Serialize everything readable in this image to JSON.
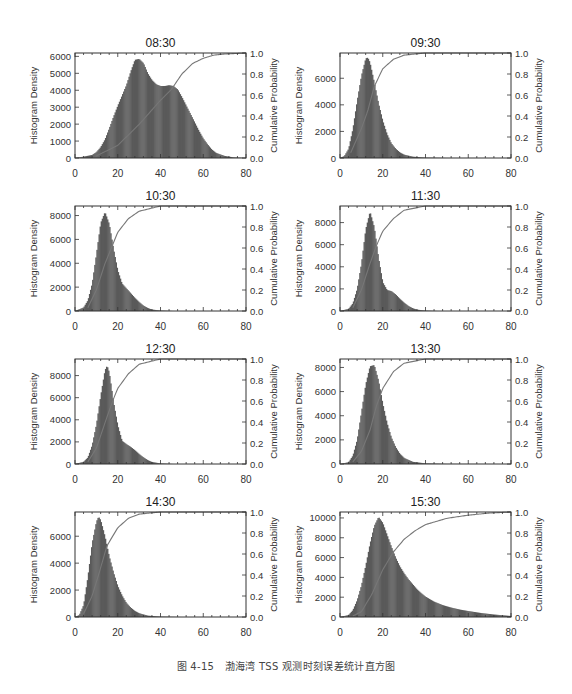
{
  "caption": "图 4-15　渤海湾 TSS 观测时刻误差统计直方图",
  "colors": {
    "bar": "#5a5a5a",
    "cdf": "#777777",
    "axis": "#333333",
    "text": "#333333"
  },
  "chart_data": [
    {
      "type": "bar",
      "title": "08:30",
      "xlabel": "",
      "ylabel": "Histogram Density",
      "y2label": "Cumulative Probability",
      "xlim": [
        0,
        80
      ],
      "ylim": [
        0,
        6200
      ],
      "y2lim": [
        0,
        1.0
      ],
      "xticks": [
        0,
        20,
        40,
        60,
        80
      ],
      "yticks": [
        0,
        1000,
        2000,
        3000,
        4000,
        5000,
        6000
      ],
      "y2ticks": [
        0.0,
        0.2,
        0.4,
        0.6,
        0.8,
        1.0
      ],
      "x": [
        0,
        4,
        8,
        10,
        12,
        14,
        16,
        18,
        20,
        22,
        24,
        26,
        28,
        30,
        32,
        34,
        36,
        38,
        40,
        42,
        44,
        46,
        48,
        50,
        52,
        54,
        56,
        58,
        60,
        62,
        64,
        66,
        70,
        74,
        80
      ],
      "density": [
        0,
        80,
        180,
        350,
        650,
        1100,
        1750,
        2450,
        3100,
        3700,
        4300,
        5100,
        5800,
        5850,
        5600,
        5000,
        4600,
        4350,
        4250,
        4250,
        4300,
        4250,
        4050,
        3600,
        3100,
        2600,
        2100,
        1600,
        1150,
        800,
        500,
        300,
        120,
        40,
        0
      ],
      "cdf_x": [
        10,
        20,
        30,
        40,
        45,
        50,
        55,
        60,
        65,
        70,
        80
      ],
      "cdf": [
        0.02,
        0.12,
        0.32,
        0.55,
        0.65,
        0.8,
        0.9,
        0.95,
        0.98,
        0.99,
        1.0
      ]
    },
    {
      "type": "bar",
      "title": "09:30",
      "xlabel": "",
      "ylabel": "Histogram Density",
      "y2label": "Cumulative Probability",
      "xlim": [
        0,
        80
      ],
      "ylim": [
        0,
        7900
      ],
      "y2lim": [
        0,
        1.0
      ],
      "xticks": [
        0,
        20,
        40,
        60,
        80
      ],
      "yticks": [
        0,
        2000,
        4000,
        6000
      ],
      "y2ticks": [
        0.0,
        0.2,
        0.4,
        0.6,
        0.8,
        1.0
      ],
      "x": [
        0,
        2,
        4,
        6,
        8,
        10,
        12,
        13,
        14,
        16,
        18,
        20,
        22,
        24,
        26,
        28,
        30,
        34,
        40,
        50,
        80
      ],
      "density": [
        0,
        150,
        700,
        2200,
        4300,
        6200,
        7500,
        7550,
        7200,
        5700,
        4100,
        2800,
        1800,
        1100,
        700,
        420,
        250,
        100,
        30,
        5,
        0
      ],
      "cdf_x": [
        5,
        10,
        13,
        16,
        20,
        25,
        30,
        40,
        80
      ],
      "cdf": [
        0.05,
        0.28,
        0.45,
        0.68,
        0.85,
        0.94,
        0.98,
        1.0,
        1.0
      ]
    },
    {
      "type": "bar",
      "title": "10:30",
      "xlabel": "",
      "ylabel": "Histogram Density",
      "y2label": "Cumulative Probability",
      "xlim": [
        0,
        80
      ],
      "ylim": [
        0,
        8800
      ],
      "y2lim": [
        0,
        1.0
      ],
      "xticks": [
        0,
        20,
        40,
        60,
        80
      ],
      "yticks": [
        0,
        2000,
        4000,
        6000,
        8000
      ],
      "y2ticks": [
        0.0,
        0.2,
        0.4,
        0.6,
        0.8,
        1.0
      ],
      "x": [
        0,
        4,
        6,
        8,
        10,
        12,
        14,
        16,
        18,
        20,
        22,
        24,
        26,
        28,
        30,
        32,
        34,
        36,
        40,
        46,
        80
      ],
      "density": [
        0,
        300,
        900,
        2300,
        4800,
        7400,
        8300,
        7300,
        5200,
        3400,
        2300,
        1900,
        1500,
        1100,
        750,
        450,
        250,
        120,
        40,
        0,
        0
      ],
      "cdf_x": [
        6,
        10,
        14,
        17,
        20,
        25,
        30,
        40,
        80
      ],
      "cdf": [
        0.03,
        0.2,
        0.45,
        0.6,
        0.75,
        0.88,
        0.95,
        1.0,
        1.0
      ]
    },
    {
      "type": "bar",
      "title": "11:30",
      "xlabel": "",
      "ylabel": "Histogram Density",
      "y2label": "Cumulative Probability",
      "xlim": [
        0,
        80
      ],
      "ylim": [
        0,
        9500
      ],
      "y2lim": [
        0,
        1.0
      ],
      "xticks": [
        0,
        20,
        40,
        60,
        80
      ],
      "yticks": [
        0,
        2000,
        4000,
        6000,
        8000
      ],
      "y2ticks": [
        0.0,
        0.2,
        0.4,
        0.6,
        0.8,
        1.0
      ],
      "x": [
        0,
        4,
        6,
        8,
        10,
        12,
        14,
        16,
        18,
        20,
        22,
        24,
        26,
        28,
        30,
        32,
        34,
        36,
        40,
        46,
        80
      ],
      "density": [
        0,
        200,
        700,
        2000,
        4300,
        7400,
        9000,
        7600,
        4800,
        2600,
        1900,
        1800,
        1500,
        1100,
        750,
        450,
        250,
        120,
        40,
        0,
        0
      ],
      "cdf_x": [
        6,
        10,
        14,
        17,
        20,
        25,
        30,
        40,
        80
      ],
      "cdf": [
        0.03,
        0.2,
        0.45,
        0.62,
        0.76,
        0.88,
        0.96,
        1.0,
        1.0
      ]
    },
    {
      "type": "bar",
      "title": "12:30",
      "xlabel": "",
      "ylabel": "Histogram Density",
      "y2label": "Cumulative Probability",
      "xlim": [
        0,
        80
      ],
      "ylim": [
        0,
        9500
      ],
      "y2lim": [
        0,
        1.0
      ],
      "xticks": [
        0,
        20,
        40,
        60,
        80
      ],
      "yticks": [
        0,
        2000,
        4000,
        6000,
        8000
      ],
      "y2ticks": [
        0.0,
        0.2,
        0.4,
        0.6,
        0.8,
        1.0
      ],
      "x": [
        0,
        4,
        6,
        8,
        10,
        12,
        14,
        15,
        16,
        18,
        20,
        22,
        24,
        26,
        28,
        30,
        32,
        34,
        36,
        40,
        46,
        80
      ],
      "density": [
        0,
        200,
        600,
        1700,
        3600,
        6200,
        8500,
        8900,
        8300,
        5600,
        3500,
        2100,
        1800,
        1550,
        1250,
        900,
        600,
        350,
        180,
        50,
        0,
        0
      ],
      "cdf_x": [
        6,
        10,
        15,
        18,
        20,
        25,
        30,
        40,
        80
      ],
      "cdf": [
        0.02,
        0.15,
        0.45,
        0.62,
        0.72,
        0.86,
        0.95,
        1.0,
        1.0
      ]
    },
    {
      "type": "bar",
      "title": "13:30",
      "xlabel": "",
      "ylabel": "Histogram Density",
      "y2label": "Cumulative Probability",
      "xlim": [
        0,
        80
      ],
      "ylim": [
        0,
        8700
      ],
      "y2lim": [
        0,
        1.0
      ],
      "xticks": [
        0,
        20,
        40,
        60,
        80
      ],
      "yticks": [
        0,
        2000,
        4000,
        6000,
        8000
      ],
      "y2ticks": [
        0.0,
        0.2,
        0.4,
        0.6,
        0.8,
        1.0
      ],
      "x": [
        0,
        4,
        6,
        8,
        10,
        12,
        14,
        16,
        18,
        20,
        22,
        24,
        26,
        28,
        30,
        34,
        40,
        50,
        80
      ],
      "density": [
        0,
        150,
        700,
        2000,
        4300,
        6600,
        8100,
        8200,
        6900,
        5000,
        3400,
        2200,
        1400,
        850,
        500,
        180,
        50,
        10,
        0
      ],
      "cdf_x": [
        6,
        10,
        14,
        17,
        20,
        25,
        30,
        40,
        80
      ],
      "cdf": [
        0.02,
        0.12,
        0.32,
        0.55,
        0.72,
        0.88,
        0.96,
        1.0,
        1.0
      ]
    },
    {
      "type": "bar",
      "title": "14:30",
      "xlabel": "",
      "ylabel": "Histogram Density",
      "y2label": "Cumulative Probability",
      "xlim": [
        0,
        80
      ],
      "ylim": [
        0,
        7800
      ],
      "y2lim": [
        0,
        1.0
      ],
      "xticks": [
        0,
        20,
        40,
        60,
        80
      ],
      "yticks": [
        0,
        2000,
        4000,
        6000
      ],
      "y2ticks": [
        0.0,
        0.2,
        0.4,
        0.6,
        0.8,
        1.0
      ],
      "x": [
        0,
        2,
        4,
        6,
        8,
        10,
        11,
        12,
        14,
        16,
        18,
        20,
        22,
        24,
        26,
        28,
        30,
        34,
        40,
        50,
        80
      ],
      "density": [
        0,
        150,
        900,
        3000,
        5500,
        7100,
        7450,
        7200,
        6000,
        4500,
        3300,
        2300,
        1600,
        1050,
        700,
        450,
        280,
        100,
        30,
        0,
        0
      ],
      "cdf_x": [
        4,
        8,
        11,
        15,
        20,
        25,
        30,
        40,
        80
      ],
      "cdf": [
        0.03,
        0.2,
        0.4,
        0.68,
        0.85,
        0.94,
        0.98,
        1.0,
        1.0
      ]
    },
    {
      "type": "bar",
      "title": "15:30",
      "xlabel": "",
      "ylabel": "Histogram Density",
      "y2label": "Cumulative Probability",
      "xlim": [
        0,
        80
      ],
      "ylim": [
        0,
        10600
      ],
      "y2lim": [
        0,
        1.0
      ],
      "xticks": [
        0,
        20,
        40,
        60,
        80
      ],
      "yticks": [
        0,
        2000,
        4000,
        6000,
        8000,
        10000
      ],
      "y2ticks": [
        0.0,
        0.2,
        0.4,
        0.6,
        0.8,
        1.0
      ],
      "x": [
        0,
        4,
        6,
        8,
        10,
        12,
        14,
        16,
        18,
        20,
        22,
        24,
        26,
        28,
        30,
        32,
        34,
        36,
        38,
        40,
        44,
        48,
        52,
        56,
        60,
        66,
        72,
        80
      ],
      "density": [
        0,
        200,
        700,
        1700,
        3200,
        5200,
        7400,
        9200,
        10100,
        9500,
        8300,
        7100,
        6000,
        5100,
        4400,
        3800,
        3300,
        2800,
        2400,
        2050,
        1550,
        1200,
        950,
        750,
        600,
        400,
        250,
        100
      ],
      "cdf_x": [
        6,
        10,
        15,
        20,
        25,
        30,
        35,
        40,
        50,
        60,
        70,
        80
      ],
      "cdf": [
        0.01,
        0.05,
        0.22,
        0.45,
        0.62,
        0.74,
        0.82,
        0.88,
        0.94,
        0.97,
        0.99,
        1.0
      ]
    }
  ]
}
